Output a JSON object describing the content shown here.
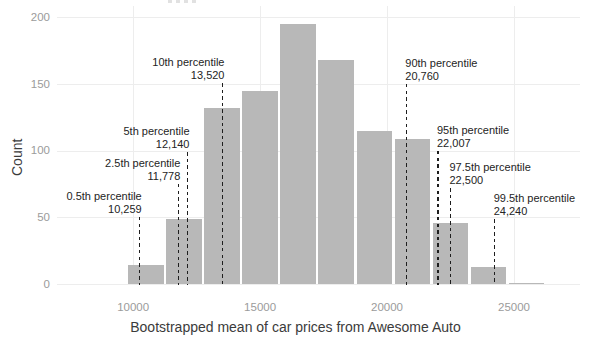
{
  "chart_data": {
    "type": "histogram",
    "xlabel": "Bootstrapped mean of car prices from Awesome Auto",
    "ylabel": "Count",
    "x_ticks": [
      10000,
      15000,
      20000,
      25000
    ],
    "y_ticks": [
      0,
      50,
      100,
      150,
      200
    ],
    "xlim": [
      7000,
      27600
    ],
    "ylim": [
      0,
      208.5
    ],
    "grid": true,
    "bin_start": 9750,
    "bin_width": 1500,
    "counts": [
      14,
      49,
      132,
      145,
      195,
      168,
      115,
      109,
      46,
      13,
      1
    ],
    "bar_color": "#b8b8b8",
    "grid_color": "#ededed",
    "tick_label_color": "#9b9b9b",
    "axis_title_color": "#3b3b3b",
    "annotation_color": "#242424",
    "annotations": [
      {
        "name": "0.5th percentile",
        "value_text": "10,259",
        "value": 10259,
        "align": "right",
        "label_top": 190
      },
      {
        "name": "2.5th percentile",
        "value_text": "11,778",
        "value": 11778,
        "align": "right",
        "label_top": 157
      },
      {
        "name": "5th percentile",
        "value_text": "12,140",
        "value": 12140,
        "align": "right",
        "label_top": 125
      },
      {
        "name": "10th percentile",
        "value_text": "13,520",
        "value": 13520,
        "align": "right",
        "label_top": 56
      },
      {
        "name": "90th percentile",
        "value_text": "20,760",
        "value": 20760,
        "align": "left",
        "label_top": 57
      },
      {
        "name": "95th percentile",
        "value_text": "22,007",
        "value": 22007,
        "align": "left",
        "label_top": 124
      },
      {
        "name": "97.5th percentile",
        "value_text": "22,500",
        "value": 22500,
        "align": "left",
        "label_top": 161
      },
      {
        "name": "99.5th percentile",
        "value_text": "24,240",
        "value": 24240,
        "align": "left",
        "label_top": 192
      }
    ]
  }
}
